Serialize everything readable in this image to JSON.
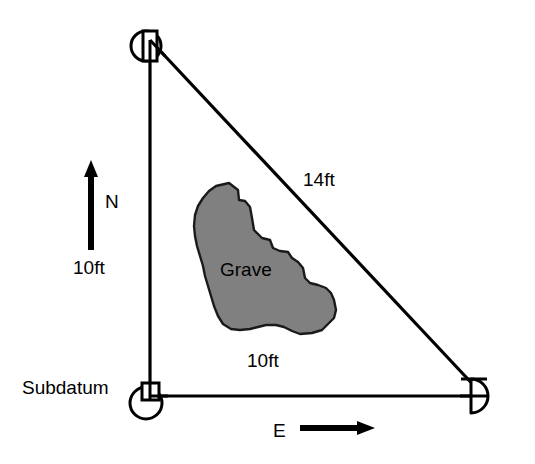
{
  "diagram": {
    "type": "site-plan-sketch",
    "background_color": "#ffffff",
    "line_color": "#000000",
    "fill_color": "#808080",
    "labels": {
      "subdatum": "Subdatum",
      "vertical_measure": "10ft",
      "hypotenuse_measure": "14ft",
      "horizontal_measure": "10ft",
      "feature": "Grave",
      "north": "N",
      "east": "E"
    },
    "measurements": [
      {
        "name": "north-leg",
        "value": "10ft",
        "orientation": "vertical"
      },
      {
        "name": "east-leg",
        "value": "10ft",
        "orientation": "horizontal"
      },
      {
        "name": "hypotenuse",
        "value": "14ft",
        "orientation": "diagonal"
      }
    ],
    "compass": {
      "north_label": "N",
      "north_direction": "up",
      "east_label": "E",
      "east_direction": "right"
    },
    "datum_points": [
      {
        "name": "datum-point-north",
        "marker": "circle-with-square",
        "position": "top-left"
      },
      {
        "name": "datum-point-subdatum",
        "marker": "circle-with-square",
        "position": "bottom-left"
      },
      {
        "name": "datum-point-east",
        "marker": "half-disc",
        "position": "bottom-right"
      }
    ],
    "feature_shape": {
      "name": "grave",
      "fill": "#808080",
      "stroke": "#1a1a1a",
      "outline_points": "216,186 229,183 238,190 239,200 245,201 250,207 252,218 254,230 262,238 270,240 273,248 280,251 288,252 292,258 298,262 303,268 305,278 310,283 318,285 326,288 331,293 334,300 336,310 334,318 328,324 322,330 312,333 300,334 292,331 284,327 276,325 266,325 258,327 250,329 240,330 231,329 223,324 218,316 214,306 211,296 208,286 205,276 203,266 200,256 197,246 195,236 194,226 195,215 198,206 203,198 209,191"
    }
  }
}
